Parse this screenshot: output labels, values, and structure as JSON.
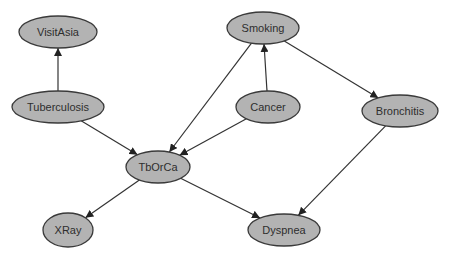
{
  "diagram": {
    "type": "bayesian-network",
    "colors": {
      "node_fill": "#b3b3b3",
      "node_stroke": "#3a3a3a",
      "edge": "#333333",
      "text": "#2e2e2e",
      "background": "#ffffff"
    },
    "nodes": [
      {
        "id": "visitasia",
        "label": "VisitAsia",
        "cx": 58,
        "cy": 32,
        "rx": 39,
        "ry": 16
      },
      {
        "id": "tuberculosis",
        "label": "Tuberculosis",
        "cx": 58,
        "cy": 107,
        "rx": 46,
        "ry": 16
      },
      {
        "id": "smoking",
        "label": "Smoking",
        "cx": 263,
        "cy": 28,
        "rx": 36,
        "ry": 16
      },
      {
        "id": "cancer",
        "label": "Cancer",
        "cx": 268,
        "cy": 107,
        "rx": 32,
        "ry": 16
      },
      {
        "id": "bronchitis",
        "label": "Bronchitis",
        "cx": 400,
        "cy": 111,
        "rx": 38,
        "ry": 16
      },
      {
        "id": "tborca",
        "label": "TbOrCa",
        "cx": 158,
        "cy": 167,
        "rx": 32,
        "ry": 16
      },
      {
        "id": "xray",
        "label": "XRay",
        "cx": 68,
        "cy": 230,
        "rx": 25,
        "ry": 17
      },
      {
        "id": "dyspnea",
        "label": "Dyspnea",
        "cx": 284,
        "cy": 230,
        "rx": 36,
        "ry": 16
      }
    ],
    "edges": [
      {
        "from": "tuberculosis",
        "to": "visitasia"
      },
      {
        "from": "tuberculosis",
        "to": "tborca"
      },
      {
        "from": "cancer",
        "to": "smoking"
      },
      {
        "from": "smoking",
        "to": "tborca"
      },
      {
        "from": "cancer",
        "to": "tborca"
      },
      {
        "from": "smoking",
        "to": "bronchitis"
      },
      {
        "from": "bronchitis",
        "to": "dyspnea"
      },
      {
        "from": "tborca",
        "to": "xray"
      },
      {
        "from": "tborca",
        "to": "dyspnea"
      }
    ]
  }
}
